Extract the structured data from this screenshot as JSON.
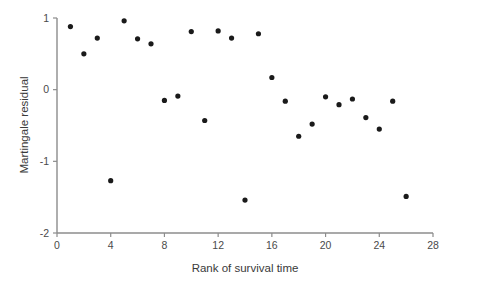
{
  "chart_data": {
    "type": "scatter",
    "title": "",
    "xlabel": "Rank of survival time",
    "ylabel": "Martingale residual",
    "xlim": [
      0,
      28
    ],
    "ylim": [
      -2,
      1
    ],
    "xticks": [
      0,
      4,
      8,
      12,
      16,
      20,
      24,
      28
    ],
    "xtick_labels": [
      "0",
      "4",
      "8",
      "12",
      "16",
      "20",
      "24",
      "28"
    ],
    "yticks": [
      1,
      0,
      -1,
      -2
    ],
    "ytick_labels": [
      "1",
      "0",
      "-1",
      "-2"
    ],
    "grid": false,
    "legend": null,
    "marker": "filled-circle",
    "marker_color": "#1a1a1a",
    "x": [
      1,
      2,
      3,
      4,
      5,
      6,
      7,
      8,
      9,
      10,
      11,
      12,
      13,
      14,
      15,
      16,
      17,
      18,
      19,
      20,
      21,
      22,
      23,
      24,
      25,
      26
    ],
    "y": [
      0.88,
      0.5,
      0.72,
      -1.27,
      0.96,
      0.71,
      0.64,
      -0.15,
      -0.09,
      0.81,
      -0.43,
      0.82,
      0.72,
      -1.54,
      0.78,
      0.17,
      -0.16,
      -0.65,
      -0.48,
      -0.1,
      -0.21,
      -0.13,
      -0.39,
      -0.55,
      -0.16,
      -1.49
    ],
    "points": [
      {
        "x": 1,
        "y": 0.88
      },
      {
        "x": 2,
        "y": 0.5
      },
      {
        "x": 3,
        "y": 0.72
      },
      {
        "x": 4,
        "y": -1.27
      },
      {
        "x": 5,
        "y": 0.96
      },
      {
        "x": 6,
        "y": 0.71
      },
      {
        "x": 7,
        "y": 0.64
      },
      {
        "x": 8,
        "y": -0.15
      },
      {
        "x": 9,
        "y": -0.09
      },
      {
        "x": 10,
        "y": 0.81
      },
      {
        "x": 11,
        "y": -0.43
      },
      {
        "x": 12,
        "y": 0.82
      },
      {
        "x": 13,
        "y": 0.72
      },
      {
        "x": 14,
        "y": -1.54
      },
      {
        "x": 15,
        "y": 0.78
      },
      {
        "x": 16,
        "y": 0.17
      },
      {
        "x": 17,
        "y": -0.16
      },
      {
        "x": 18,
        "y": -0.65
      },
      {
        "x": 19,
        "y": -0.48
      },
      {
        "x": 20,
        "y": -0.1
      },
      {
        "x": 21,
        "y": -0.21
      },
      {
        "x": 22,
        "y": -0.13
      },
      {
        "x": 23,
        "y": -0.39
      },
      {
        "x": 24,
        "y": -0.55
      },
      {
        "x": 25,
        "y": -0.16
      },
      {
        "x": 26,
        "y": -1.49
      }
    ]
  },
  "axes": {
    "x_title": "Rank of survival time",
    "y_title": "Martingale residual"
  }
}
